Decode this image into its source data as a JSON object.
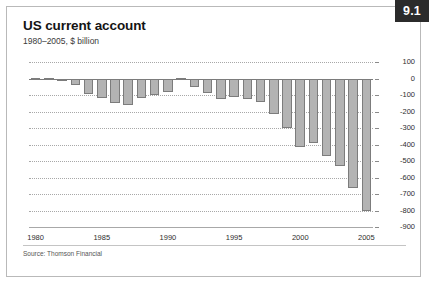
{
  "badge": {
    "label": "9.1"
  },
  "header": {
    "title": "US current account",
    "subtitle": "1980–2005, $ billion"
  },
  "footer": {
    "source": "Source: Thomson Financial"
  },
  "colors": {
    "badge_background": "#2b2b2b",
    "badge_text": "#ffffff",
    "bar_fill": "#b3b3b3",
    "bar_border": "#7c7c7c",
    "gridline": "#a8a8a8",
    "zero_line": "#7a7a7a",
    "frame_border": "#b9b9b9",
    "title_text": "#141414"
  },
  "chart_data": {
    "type": "bar",
    "title": "US current account",
    "subtitle": "1980–2005, $ billion",
    "xlabel": "",
    "ylabel": "$ billion",
    "ylim": [
      -900,
      100
    ],
    "ytick_step": 100,
    "yticks": [
      100,
      0,
      -100,
      -200,
      -300,
      -400,
      -500,
      -600,
      -700,
      -800,
      -900
    ],
    "ytick_labels": [
      "100",
      "0",
      "-100",
      "-200",
      "-300",
      "-400",
      "-500",
      "-600",
      "-700",
      "-800",
      "-900"
    ],
    "xticks": [
      1980,
      1985,
      1990,
      1995,
      2000,
      2005
    ],
    "xtick_labels": [
      "1980",
      "1985",
      "1990",
      "1995",
      "2000",
      "2005"
    ],
    "grid": true,
    "grid_style": "dotted-horizontal",
    "legend": "none",
    "source": "Source: Thomson Financial",
    "categories": [
      "1980",
      "1981",
      "1982",
      "1983",
      "1984",
      "1985",
      "1986",
      "1987",
      "1988",
      "1989",
      "1990",
      "1991",
      "1992",
      "1993",
      "1994",
      "1995",
      "1996",
      "1997",
      "1998",
      "1999",
      "2000",
      "2001",
      "2002",
      "2003",
      "2004",
      "2005"
    ],
    "values": [
      2,
      5,
      -6,
      -39,
      -94,
      -118,
      -147,
      -161,
      -121,
      -100,
      -79,
      3,
      -50,
      -85,
      -122,
      -114,
      -125,
      -141,
      -215,
      -300,
      -416,
      -389,
      -472,
      -528,
      -665,
      -805
    ]
  }
}
